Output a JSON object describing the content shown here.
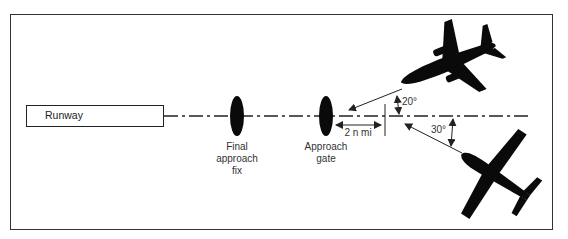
{
  "diagram": {
    "runway": {
      "label": "Runway"
    },
    "markers": [
      {
        "id": "final-approach-fix",
        "label_lines": [
          "Final",
          "approach",
          "fix"
        ]
      },
      {
        "id": "approach-gate",
        "label_lines": [
          "Approach",
          "gate"
        ]
      }
    ],
    "dimensions": {
      "distance_label": "2 n mi"
    },
    "aircraft": [
      {
        "id": "jet",
        "intercept_angle": "20°"
      },
      {
        "id": "light-aircraft",
        "intercept_angle": "30°"
      }
    ],
    "colors": {
      "line": "#222222",
      "silhouette": "#0a0a0a",
      "frame": "#333333"
    }
  }
}
